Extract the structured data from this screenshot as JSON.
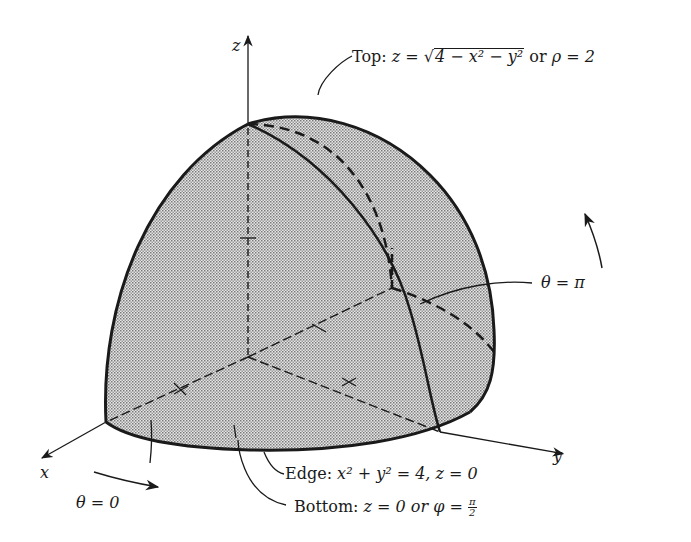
{
  "figure": {
    "type": "3D diagram of a quarter-sphere solid region (spherical coordinates)",
    "shading_color": "#c8c8c8",
    "stroke_color": "#1a1a1a",
    "axes": {
      "x_label": "x",
      "y_label": "y",
      "z_label": "z"
    },
    "annotations": {
      "top": {
        "prefix": "Top: ",
        "z_eq": "z = ",
        "sqrt_expr": "4 − x² − y²",
        "or_text": " or ",
        "rho_eq": "ρ = 2"
      },
      "theta_pi": "θ = π",
      "edge": {
        "prefix": "Edge: ",
        "equation": "x² + y² = 4, z = 0"
      },
      "bottom": {
        "prefix": "Bottom: ",
        "eq1": "z = 0 or ",
        "phi": "φ = ",
        "frac_num": "π",
        "frac_den": "2"
      },
      "theta_zero": "θ = 0"
    }
  }
}
